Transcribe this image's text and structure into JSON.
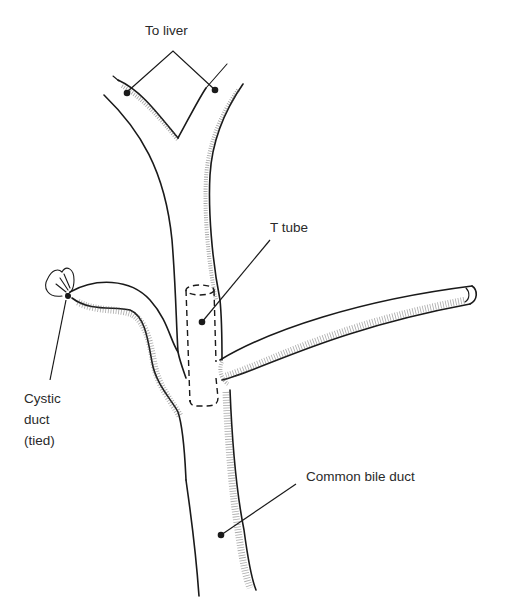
{
  "diagram": {
    "type": "anatomical illustration",
    "labels": {
      "to_liver": "To liver",
      "t_tube": "T tube",
      "cystic_duct_line1": "Cystic",
      "cystic_duct_line2": "duct",
      "cystic_duct_line3": "(tied)",
      "common_bile_duct": "Common bile duct"
    },
    "colors": {
      "ink": "#1a1a1a",
      "background": "#ffffff"
    }
  }
}
